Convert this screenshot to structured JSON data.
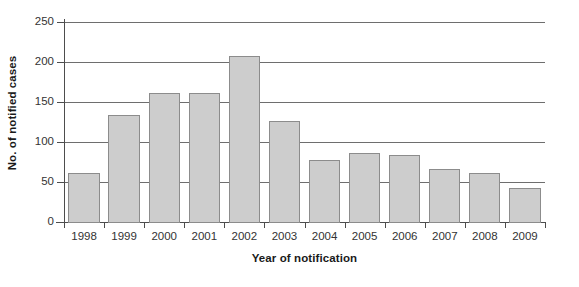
{
  "chart_data": {
    "type": "bar",
    "title": "",
    "xlabel": "Year of notification",
    "ylabel": "No. of notified cases",
    "categories": [
      "1998",
      "1999",
      "2000",
      "2001",
      "2002",
      "2003",
      "2004",
      "2005",
      "2006",
      "2007",
      "2008",
      "2009"
    ],
    "values": [
      62,
      135,
      162,
      163,
      209,
      128,
      79,
      88,
      85,
      68,
      63,
      44
    ],
    "series": [
      {
        "name": "No. of notified cases",
        "values": [
          62,
          135,
          162,
          163,
          209,
          128,
          79,
          88,
          85,
          68,
          63,
          44
        ]
      }
    ],
    "ylim": [
      0,
      250
    ],
    "yticks": [
      0,
      50,
      100,
      150,
      200,
      250
    ],
    "ytick_labels": [
      "0",
      "50",
      "100",
      "150",
      "200",
      "250"
    ],
    "grid": true,
    "grid_axis": "y",
    "legend": false,
    "legend_position": "none",
    "bar_fill_color": "#cdcdcd",
    "bar_border_color": "#8c8c8c",
    "gridline_color": "#6e6e6e",
    "axis_color": "#4d4d4d",
    "background_color": "#ffffff"
  }
}
